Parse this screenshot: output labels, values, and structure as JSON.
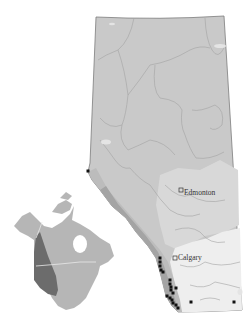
{
  "map": {
    "title": "",
    "region": "Alberta",
    "colors": {
      "background": "#ffffff",
      "region_boreal": "#c8c8c8",
      "region_parkland": "#d6d6d6",
      "region_grassland": "#ececec",
      "region_foothills": "#bdbdbd",
      "region_rockies": "#a6a6a6",
      "boundary": "#9a9a9a",
      "outline": "#7c7c7c",
      "occurrence": "#111111",
      "inset_land": "#b4b4b4",
      "inset_range": "#6e6e6e"
    },
    "cities": [
      {
        "name": "Edmonton",
        "marker": "open-square"
      },
      {
        "name": "Calgary",
        "marker": "open-square"
      }
    ],
    "inset": {
      "label": "",
      "description": "North America with highlighted western range"
    },
    "occurrence_points": [
      [
        88,
        171
      ],
      [
        160,
        258
      ],
      [
        160,
        262
      ],
      [
        160,
        266
      ],
      [
        161,
        270
      ],
      [
        163,
        272
      ],
      [
        170,
        280
      ],
      [
        170,
        284
      ],
      [
        171,
        287
      ],
      [
        171,
        290
      ],
      [
        173,
        293
      ],
      [
        176,
        288
      ],
      [
        167,
        296
      ],
      [
        170,
        298
      ],
      [
        172,
        300
      ],
      [
        173,
        303
      ],
      [
        176,
        305
      ],
      [
        178,
        308
      ],
      [
        191,
        302
      ],
      [
        234,
        302
      ]
    ]
  }
}
